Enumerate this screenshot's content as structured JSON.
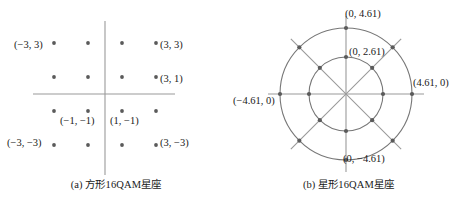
{
  "figure": {
    "panels": [
      {
        "id": "square-16qam",
        "caption": "(a) 方形16QAM星座",
        "labels": [
          {
            "name": "label-m3-3",
            "text": "(−3, 3)",
            "x": 14,
            "y": 39,
            "align": "left"
          },
          {
            "name": "label-3-3",
            "text": "(3, 3)",
            "x": 160,
            "y": 39,
            "align": "left"
          },
          {
            "name": "label-3-1",
            "text": "(3, 1)",
            "x": 160,
            "y": 73,
            "align": "left"
          },
          {
            "name": "label-m1-m1",
            "text": "(−1, −1)",
            "x": 60,
            "y": 115,
            "align": "left"
          },
          {
            "name": "label-1-m1",
            "text": "(1, −1)",
            "x": 110,
            "y": 115,
            "align": "left"
          },
          {
            "name": "label-m3-m3",
            "text": "(−3, −3)",
            "x": 7,
            "y": 137,
            "align": "left"
          },
          {
            "name": "label-3-m3",
            "text": "(3, −3)",
            "x": 160,
            "y": 137,
            "align": "left"
          }
        ]
      },
      {
        "id": "star-16qam",
        "caption": "(b) 星形16QAM星座",
        "labels": [
          {
            "name": "label-0-461",
            "text": "(0, 4.61)",
            "x": 113,
            "y": 8,
            "align": "left"
          },
          {
            "name": "label-0-261",
            "text": "(0, 2.61)",
            "x": 117,
            "y": 46,
            "align": "left"
          },
          {
            "name": "label-461-0",
            "text": "(4.61, 0)",
            "x": 181,
            "y": 77,
            "align": "left"
          },
          {
            "name": "label-m461-0",
            "text": "(−4.61, 0)",
            "x": 1,
            "y": 95,
            "align": "left"
          },
          {
            "name": "label-0-m461",
            "text": "(0, −4.61)",
            "x": 111,
            "y": 153,
            "align": "left"
          }
        ]
      }
    ]
  },
  "chart_data": [
    {
      "type": "scatter",
      "title": "(a) 方形16QAM星座",
      "xlabel": "",
      "ylabel": "",
      "axes": {
        "origin_px": [
          105,
          94
        ],
        "x_range_px": [
          33,
          175
        ],
        "y_range_px": [
          21,
          175
        ],
        "grid": false,
        "ticks": false
      },
      "annotations": [
        "(−3, 3)",
        "(3, 3)",
        "(3, 1)",
        "(−1, −1)",
        "(1, −1)",
        "(−3, −3)",
        "(3, −3)"
      ],
      "points": [
        {
          "x": -3,
          "y": 3
        },
        {
          "x": -1,
          "y": 3
        },
        {
          "x": 1,
          "y": 3
        },
        {
          "x": 3,
          "y": 3
        },
        {
          "x": -3,
          "y": 1
        },
        {
          "x": -1,
          "y": 1
        },
        {
          "x": 1,
          "y": 1
        },
        {
          "x": 3,
          "y": 1
        },
        {
          "x": -3,
          "y": -1
        },
        {
          "x": -1,
          "y": -1
        },
        {
          "x": 1,
          "y": -1
        },
        {
          "x": 3,
          "y": -1
        },
        {
          "x": -3,
          "y": -3
        },
        {
          "x": -1,
          "y": -3
        },
        {
          "x": 1,
          "y": -3
        },
        {
          "x": 3,
          "y": -3
        }
      ]
    },
    {
      "type": "scatter",
      "title": "(b) 星形16QAM星座",
      "xlabel": "",
      "ylabel": "",
      "axes": {
        "center_px": [
          114,
          94
        ],
        "grid": false,
        "ticks": false
      },
      "annotations": [
        "(0, 4.61)",
        "(0, 2.61)",
        "(4.61, 0)",
        "(−4.61, 0)",
        "(0, −4.61)"
      ],
      "rings": [
        {
          "radius": 2.61,
          "radius_px": 37,
          "n_points": 8,
          "angles_deg": [
            0,
            45,
            90,
            135,
            180,
            225,
            270,
            315
          ]
        },
        {
          "radius": 4.61,
          "radius_px": 66,
          "n_points": 8,
          "angles_deg": [
            0,
            45,
            90,
            135,
            180,
            225,
            270,
            315
          ]
        }
      ],
      "spokes_deg": [
        0,
        45,
        90,
        135
      ],
      "spoke_extent_px": 78
    }
  ],
  "style": {
    "dot_color": "#5a5a5a",
    "line_color": "#9a9a9a",
    "circle_color": "#777777",
    "text_color": "#1a1a1a"
  }
}
